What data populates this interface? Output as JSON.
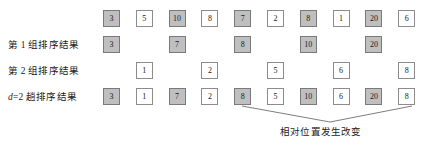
{
  "figure": {
    "title_visible": false,
    "geometry": {
      "cell_width": 17,
      "cell_height": 17,
      "col_pitch": 32.8,
      "first_col_x": 103,
      "row_ys": [
        10,
        36,
        62,
        88
      ]
    },
    "colors": {
      "gray_fill": "#bfbfbf",
      "white_fill": "#ffffff",
      "border": "#8c8c8c",
      "text": "#1a1a1a",
      "line": "#6e6e6e"
    },
    "rows": [
      {
        "label": "",
        "label_parts": [],
        "cells": [
          {
            "value": "3",
            "style": "gray"
          },
          {
            "value": "5",
            "style": "white"
          },
          {
            "value": "10",
            "style": "gray"
          },
          {
            "value": "8",
            "style": "white"
          },
          {
            "value": "7",
            "style": "gray"
          },
          {
            "value": "2",
            "style": "white"
          },
          {
            "value": "8",
            "style": "gray"
          },
          {
            "value": "1",
            "style": "white"
          },
          {
            "value": "20",
            "style": "gray"
          },
          {
            "value": "6",
            "style": "white"
          }
        ]
      },
      {
        "label": "第 1 组排序结果",
        "label_parts": [],
        "cells": [
          {
            "value": "3",
            "style": "gray"
          },
          {
            "value": "",
            "style": "empty"
          },
          {
            "value": "7",
            "style": "gray"
          },
          {
            "value": "",
            "style": "empty"
          },
          {
            "value": "8",
            "style": "gray"
          },
          {
            "value": "",
            "style": "empty"
          },
          {
            "value": "10",
            "style": "gray"
          },
          {
            "value": "",
            "style": "empty"
          },
          {
            "value": "20",
            "style": "gray"
          },
          {
            "value": "",
            "style": "empty"
          }
        ]
      },
      {
        "label": "第 2 组排序结果",
        "label_parts": [],
        "cells": [
          {
            "value": "",
            "style": "empty"
          },
          {
            "value": "1",
            "style": "white"
          },
          {
            "value": "",
            "style": "empty"
          },
          {
            "value": "2",
            "style": "white"
          },
          {
            "value": "",
            "style": "empty"
          },
          {
            "value": "5",
            "style": "white"
          },
          {
            "value": "",
            "style": "empty"
          },
          {
            "value": "6",
            "style": "white"
          },
          {
            "value": "",
            "style": "empty"
          },
          {
            "value": "8",
            "style": "white"
          }
        ]
      },
      {
        "label": "d=2 趟排序结果",
        "label_parts": [
          {
            "text": "d",
            "italic": true
          },
          {
            "text": "=2 趟排序结果",
            "italic": false
          }
        ],
        "cells": [
          {
            "value": "3",
            "style": "gray"
          },
          {
            "value": "1",
            "style": "white"
          },
          {
            "value": "7",
            "style": "gray"
          },
          {
            "value": "2",
            "style": "white"
          },
          {
            "value": "8",
            "style": "gray"
          },
          {
            "value": "5",
            "style": "white"
          },
          {
            "value": "10",
            "style": "gray"
          },
          {
            "value": "6",
            "style": "white"
          },
          {
            "value": "20",
            "style": "gray"
          },
          {
            "value": "8",
            "style": "white"
          }
        ]
      }
    ],
    "annotation": {
      "text": "相对位置发生改变",
      "x": 280,
      "y": 128,
      "leader": {
        "left_anchor": {
          "x": 242,
          "y": 106
        },
        "right_anchor": {
          "x": 412,
          "y": 106
        },
        "vertex": {
          "x": 330,
          "y": 122
        }
      }
    }
  }
}
